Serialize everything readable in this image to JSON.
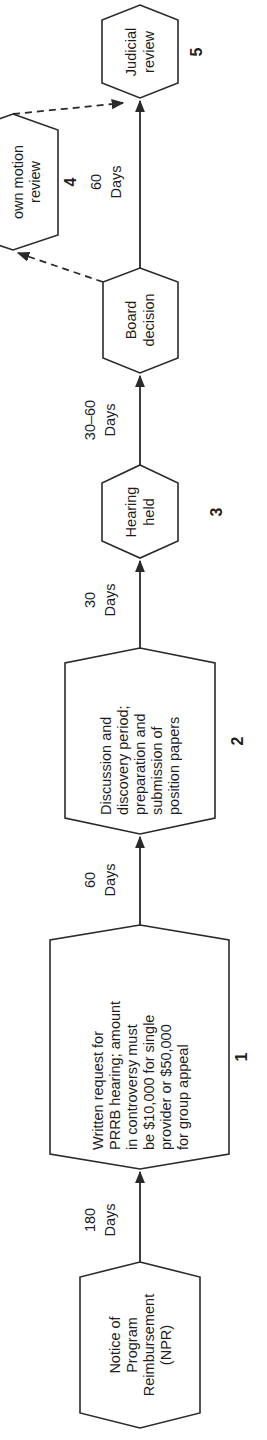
{
  "diagram": {
    "orientation": "rotated-90-ccw",
    "steps": [
      {
        "id": "npr",
        "number": "",
        "lines": [
          "Notice of",
          "Program",
          "Reimbursement",
          "(NPR)"
        ]
      },
      {
        "id": "step1",
        "number": "1",
        "lines": [
          "Written request for",
          "PRRB hearing; amount",
          "in controversy must",
          "be $10,000 for single",
          "provider or $50,000",
          "for group appeal"
        ]
      },
      {
        "id": "step2",
        "number": "2",
        "lines": [
          "Discussion and",
          "discovery period;",
          "preparation and",
          "submission of",
          "position papers"
        ]
      },
      {
        "id": "step3",
        "number": "3",
        "lines": [
          "Hearing",
          "held"
        ]
      },
      {
        "id": "board",
        "number": "",
        "lines": [
          "Board",
          "decision"
        ]
      },
      {
        "id": "step4",
        "number": "4",
        "lines": [
          "own motion",
          "review"
        ]
      },
      {
        "id": "step5",
        "number": "5",
        "lines": [
          "Judicial",
          "review"
        ]
      }
    ],
    "durations": [
      {
        "between": "npr-step1",
        "lines": [
          "180",
          "Days"
        ]
      },
      {
        "between": "step1-step2",
        "lines": [
          "60",
          "Days"
        ]
      },
      {
        "between": "step2-step3",
        "lines": [
          "30",
          "Days"
        ]
      },
      {
        "between": "step3-board",
        "lines": [
          "30–60",
          "Days"
        ]
      },
      {
        "between": "board-step5",
        "lines": [
          "60",
          "Days"
        ]
      }
    ],
    "dashed_links": [
      {
        "from": "board",
        "to": "step4"
      },
      {
        "from": "step4",
        "to": "step5"
      }
    ]
  }
}
